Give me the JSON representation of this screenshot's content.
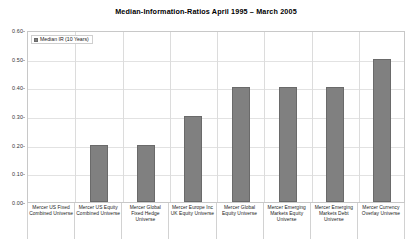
{
  "chart_data": {
    "type": "bar",
    "title": "Median-Information-Ratios  April 1995 – March 2005",
    "xlabel": "",
    "ylabel": "",
    "ylim": [
      0.0,
      0.6
    ],
    "ytick_labels": [
      "0.60",
      "0.50",
      "0.40",
      "0.30",
      "0.20",
      "0.10",
      "0.00"
    ],
    "ytick_values": [
      0.6,
      0.5,
      0.4,
      0.3,
      0.2,
      0.1,
      0.0
    ],
    "grid": true,
    "legend_position": "top-left",
    "legend": [
      "Median IR (10 Years)"
    ],
    "bar_color": "#808080",
    "bar_border_color": "#6a6a6a",
    "categories": [
      "Mercer US Fixed Combined Universe",
      "Mercer US Equity Combined Universe",
      "Mercer Global Fixed Hedge Universe",
      "Mercer Europe Inc UK Equity Universe",
      "Mercer Global Equity Universe",
      "Mercer Emerging Markets Equity Universe",
      "Mercer Emerging Markets Debt Universe",
      "Mercer Currency Overlay Universe"
    ],
    "series": [
      {
        "name": "Median IR (10 Years)",
        "values": [
          0.0,
          0.2,
          0.2,
          0.3,
          0.4,
          0.4,
          0.4,
          0.5
        ]
      }
    ]
  }
}
